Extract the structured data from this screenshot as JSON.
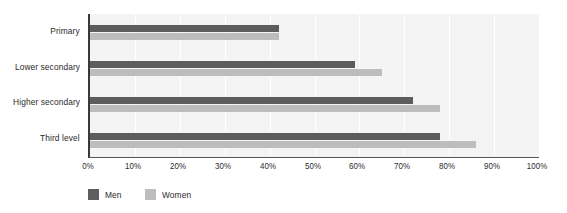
{
  "chart_data": {
    "type": "bar",
    "orientation": "horizontal",
    "title": "",
    "xlabel": "",
    "ylabel": "",
    "categories": [
      "Primary",
      "Lower secondary",
      "Higher secondary",
      "Third level"
    ],
    "series": [
      {
        "name": "Men",
        "color": "#5d5d5d",
        "values": [
          42,
          59,
          72,
          78
        ]
      },
      {
        "name": "Women",
        "color": "#bdbdbd",
        "values": [
          42,
          65,
          78,
          86
        ]
      }
    ],
    "xlim": [
      0,
      100
    ],
    "xticks": [
      0,
      10,
      20,
      30,
      40,
      50,
      60,
      70,
      80,
      90,
      100
    ],
    "xtick_labels": [
      "0%",
      "10%",
      "20%",
      "30%",
      "40%",
      "50%",
      "60%",
      "70%",
      "80%",
      "90%",
      "100%"
    ],
    "grid": true,
    "grid_axis": "x",
    "legend_position": "bottom-left",
    "value_suffix": "%",
    "plot_background": "#f4f4f4",
    "gridline_color": "#ffffff",
    "axis_color": "#3a3a3a",
    "text_color": "#2b2b2b"
  },
  "legend": {
    "items": [
      {
        "label": "Men",
        "swatch": "men"
      },
      {
        "label": "Women",
        "swatch": "women"
      }
    ]
  }
}
